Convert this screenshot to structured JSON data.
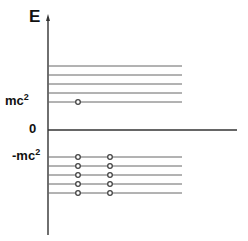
{
  "axis": {
    "label": "E"
  },
  "labels": {
    "mc2_base": "mc",
    "mc2_exp": "2",
    "zero": "0",
    "neg_mc2_base": "-mc",
    "neg_mc2_exp": "2"
  },
  "levels": {
    "positive_count": 5,
    "negative_count": 5,
    "positive_occupied": "lowest level, 1 particle",
    "negative_occupied": "all 5 levels, 2 particles each"
  },
  "colors": {
    "line": "#555555",
    "axis": "#333333",
    "dot": "#444444"
  }
}
